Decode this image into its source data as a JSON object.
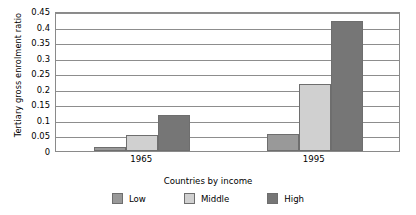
{
  "chart_data": {
    "type": "bar",
    "title": "",
    "xlabel": "Countries by income",
    "ylabel": "Tertiary gross enrolment ratio",
    "categories": [
      "1965",
      "1995"
    ],
    "series": [
      {
        "name": "Low",
        "values": [
          0.012,
          0.055
        ],
        "color": "#999999"
      },
      {
        "name": "Middle",
        "values": [
          0.052,
          0.217
        ],
        "color": "#d0d0d0"
      },
      {
        "name": "High",
        "values": [
          0.115,
          0.417
        ],
        "color": "#767676"
      }
    ],
    "ylim": [
      0,
      0.45
    ],
    "ytick_step": 0.05,
    "ytick_labels": [
      "0",
      "0.05",
      "0.1",
      "0.15",
      "0.2",
      "0.25",
      "0.3",
      "0.35",
      "0.4",
      "0.45"
    ],
    "grid": true,
    "grid_axis": "y",
    "legend_position": "bottom",
    "legend_entries": [
      "Low",
      "Middle",
      "High"
    ]
  },
  "colors": {
    "low": "#999999",
    "middle": "#d0d0d0",
    "high": "#767676",
    "gridline": "#8d8d8d",
    "axis": "#8a8a8a",
    "bar_border": "#6e6e6e",
    "background": "#ffffff",
    "text": "#000000"
  }
}
